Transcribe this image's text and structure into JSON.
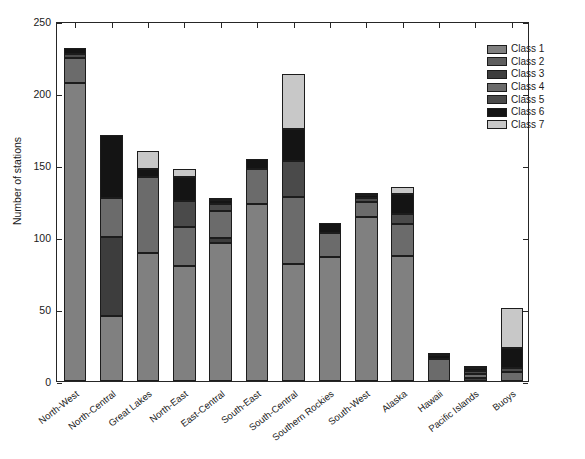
{
  "chart_data": {
    "type": "bar",
    "stacked": true,
    "title": "",
    "xlabel": "",
    "ylabel": "Number of stations",
    "ylim": [
      0,
      250
    ],
    "yticks": [
      0,
      50,
      100,
      150,
      200,
      250
    ],
    "grid": false,
    "legend_position": "top-right",
    "categories": [
      "North-West",
      "North-Central",
      "Great Lakes",
      "North-East",
      "East-Central",
      "South-East",
      "South-Central",
      "Southern Rockies",
      "South-West",
      "Alaska",
      "Hawaii",
      "Pacific Islands",
      "Buoys"
    ],
    "series": [
      {
        "name": "Class 1",
        "color": "#808080",
        "values": [
          207,
          45,
          89,
          80,
          96,
          123,
          81,
          86,
          114,
          87,
          0,
          0,
          0
        ]
      },
      {
        "name": "Class 2",
        "color": "#5e5e5e",
        "values": [
          0,
          0,
          0,
          0,
          0,
          0,
          0,
          0,
          0,
          0,
          0,
          0,
          0
        ]
      },
      {
        "name": "Class 3",
        "color": "#3d3d3d",
        "values": [
          0,
          55,
          0,
          0,
          3,
          0,
          0,
          0,
          0,
          0,
          0,
          2,
          0
        ]
      },
      {
        "name": "Class 4",
        "color": "#6b6b6b",
        "values": [
          17,
          27,
          53,
          27,
          19,
          24,
          47,
          17,
          10,
          22,
          15,
          3,
          6
        ]
      },
      {
        "name": "Class 5",
        "color": "#4a4a4a",
        "values": [
          3,
          0,
          0,
          18,
          5,
          0,
          25,
          0,
          3,
          7,
          0,
          2,
          3
        ]
      },
      {
        "name": "Class 6",
        "color": "#141414",
        "values": [
          4,
          44,
          5,
          17,
          3,
          7,
          22,
          7,
          2,
          14,
          3,
          2,
          14
        ]
      },
      {
        "name": "Class 7",
        "color": "#c8c8c8",
        "values": [
          0,
          0,
          13,
          5,
          1,
          0,
          38,
          0,
          1,
          5,
          1,
          1,
          28
        ]
      }
    ],
    "totals": [
      231,
      171,
      160,
      147,
      127,
      154,
      213,
      110,
      130,
      135,
      19,
      10,
      51
    ]
  },
  "legend": {
    "entries": [
      "Class 1",
      "Class 2",
      "Class 3",
      "Class 4",
      "Class 5",
      "Class 6",
      "Class 7"
    ]
  },
  "axis": {
    "y_label": "Number of stations",
    "y_ticks": [
      "0",
      "50",
      "100",
      "150",
      "200",
      "250"
    ]
  }
}
